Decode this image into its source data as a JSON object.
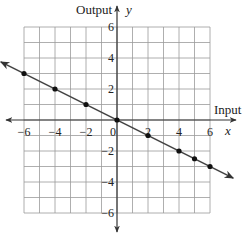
{
  "chart_data": {
    "type": "line",
    "title": "",
    "xlabel": "Input",
    "ylabel": "Output",
    "x_axis_var": "x",
    "y_axis_var": "y",
    "xlim": [
      -6,
      6
    ],
    "ylim": [
      -6,
      6
    ],
    "grid": true,
    "x_ticks": [
      -6,
      -4,
      -2,
      0,
      2,
      4,
      6
    ],
    "y_ticks": [
      6,
      4,
      2,
      -2,
      -4,
      -6
    ],
    "x_tick_labels": [
      "−6",
      "−4",
      "−2",
      "0",
      "2",
      "4",
      "6"
    ],
    "y_tick_labels": [
      "6",
      "4",
      "2",
      "−2",
      "−4",
      "−6"
    ],
    "series": [
      {
        "name": "y = -x/2",
        "x": [
          -6,
          -4,
          -2,
          0,
          2,
          4,
          5,
          6
        ],
        "y": [
          3,
          2,
          1,
          0,
          -1,
          -2,
          -2.5,
          -3
        ],
        "arrows": "both ends"
      }
    ]
  },
  "labels": {
    "output": "Output",
    "y": "y",
    "input": "Input",
    "x": "x"
  }
}
